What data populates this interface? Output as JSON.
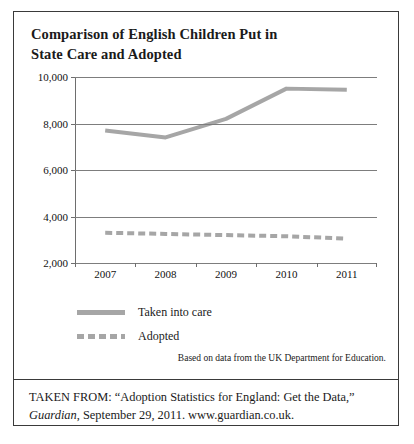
{
  "figure": {
    "title_line_1": "Comparison of English Children Put in",
    "title_line_2": "State Care and Adopted",
    "source_note": "Based on data from the UK Department for Education.",
    "citation_line_1_prefix": "TAKEN FROM: “Adoption Statistics for England: Get the Data,”",
    "citation_line_2_italic": "Guardian",
    "citation_line_2_rest": ", September 29, 2011. www.guardian.co.uk."
  },
  "colors": {
    "series_gray": "#a6a6a6",
    "gridline": "#7d7d7d",
    "axis": "#6e6e6e",
    "border": "#3a3a3a",
    "text": "#1a1a1a"
  },
  "chart_data": {
    "type": "line",
    "title": "Comparison of English Children Put in State Care and Adopted",
    "xlabel": "",
    "ylabel": "",
    "categories": [
      "2007",
      "2008",
      "2009",
      "2010",
      "2011"
    ],
    "x_tick_labels": [
      "2007",
      "2008",
      "2009",
      "2010",
      "2011"
    ],
    "y_tick_labels": [
      "10,000",
      "8,000",
      "6,000",
      "4,000",
      "2,000"
    ],
    "y_ticks": [
      10000,
      8000,
      6000,
      4000,
      2000
    ],
    "ylim": [
      2000,
      10000
    ],
    "grid": true,
    "legend_position": "below-left",
    "series": [
      {
        "name": "Taken into care",
        "style": "solid",
        "color": "#a6a6a6",
        "values": [
          7700,
          7400,
          8200,
          9500,
          9450
        ]
      },
      {
        "name": "Adopted",
        "style": "dashed",
        "color": "#a6a6a6",
        "values": [
          3300,
          3250,
          3200,
          3150,
          3050
        ]
      }
    ],
    "annotations": [
      "Based on data from the UK Department for Education."
    ]
  }
}
